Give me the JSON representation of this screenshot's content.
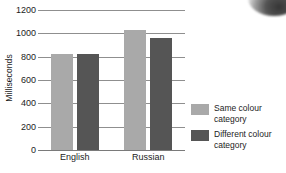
{
  "chart_data": {
    "type": "bar",
    "title": "",
    "subtitle": "",
    "xlabel": "",
    "ylabel": "Milliseconds",
    "categories": [
      "English",
      "Russian"
    ],
    "series": [
      {
        "name": "Same colour category",
        "color": "#a9a9a9",
        "values": [
          820,
          1030
        ]
      },
      {
        "name": "Different colour category",
        "color": "#555555",
        "values": [
          820,
          960
        ]
      }
    ],
    "ylim": [
      0,
      1200
    ],
    "yticks": [
      0,
      200,
      400,
      600,
      800,
      1000,
      1200
    ],
    "ytick_labels": [
      "0",
      "200",
      "400",
      "600",
      "800",
      "1000",
      "1200"
    ],
    "grid": true,
    "legend_position": "right",
    "annotations": []
  },
  "legend": {
    "entries": [
      {
        "label": "Same colour category",
        "swatch": "light-gray-swatch"
      },
      {
        "label": "Different colour category",
        "swatch": "dark-gray-swatch"
      }
    ]
  },
  "colors": {
    "same_colour_category": "#a9a9a9",
    "different_colour_category": "#555555",
    "gridline": "#8f8f8f",
    "text": "#1c1c1c",
    "background": "#ffffff"
  }
}
